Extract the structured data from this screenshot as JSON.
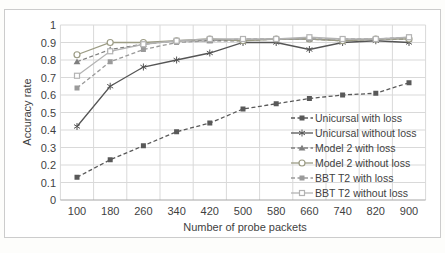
{
  "window": {
    "background": "#fdfdfb",
    "frame_border_color": "#cccccc",
    "plot_background": "#ffffff"
  },
  "chart_data": {
    "type": "line",
    "title": "",
    "xlabel": "Number of probe packets",
    "ylabel": "Accuracy rate",
    "x": [
      100,
      180,
      260,
      340,
      420,
      500,
      580,
      660,
      740,
      820,
      900
    ],
    "x_tick_labels": [
      "100",
      "180",
      "260",
      "340",
      "420",
      "500",
      "580",
      "660",
      "740",
      "820",
      "900"
    ],
    "y_tick_labels": [
      "0",
      "0.1",
      "0.2",
      "0.3",
      "0.4",
      "0.5",
      "0.6",
      "0.7",
      "0.8",
      "0.9",
      "1"
    ],
    "ylim": [
      0,
      1
    ],
    "grid": true,
    "gridline_color": "#d9d9d9",
    "axis_line_color": "#a6a6a6",
    "tick_label_color": "#3f3f3f",
    "legend_position": "inside-bottom-right",
    "legend_text_color": "#3f3f3f",
    "series": [
      {
        "name": "Unicursal with loss",
        "values": [
          0.13,
          0.23,
          0.31,
          0.39,
          0.44,
          0.52,
          0.55,
          0.58,
          0.6,
          0.61,
          0.67
        ],
        "color": "#595959",
        "line_style": "dashed",
        "marker": "square-filled"
      },
      {
        "name": "Unicursal without loss",
        "values": [
          0.42,
          0.65,
          0.76,
          0.8,
          0.84,
          0.9,
          0.9,
          0.86,
          0.9,
          0.91,
          0.9
        ],
        "color": "#555555",
        "line_style": "solid",
        "marker": "star"
      },
      {
        "name": "Model 2 with loss",
        "values": [
          0.79,
          0.86,
          0.89,
          0.91,
          0.91,
          0.91,
          0.92,
          0.92,
          0.91,
          0.92,
          0.92
        ],
        "color": "#7f7f7f",
        "line_style": "dashed",
        "marker": "triangle-filled"
      },
      {
        "name": "Model 2 without loss",
        "values": [
          0.83,
          0.9,
          0.9,
          0.91,
          0.92,
          0.91,
          0.92,
          0.92,
          0.91,
          0.92,
          0.92
        ],
        "color": "#9b9b84",
        "line_style": "solid",
        "marker": "circle-open"
      },
      {
        "name": "BBT T2 with loss",
        "values": [
          0.64,
          0.79,
          0.86,
          0.9,
          0.91,
          0.92,
          0.92,
          0.92,
          0.92,
          0.92,
          0.93
        ],
        "color": "#9a9a9a",
        "line_style": "dashed",
        "marker": "square-filled"
      },
      {
        "name": "BBT T2 without loss",
        "values": [
          0.71,
          0.85,
          0.89,
          0.91,
          0.92,
          0.92,
          0.92,
          0.93,
          0.92,
          0.92,
          0.93
        ],
        "color": "#b3b3b3",
        "line_style": "solid",
        "marker": "square-open"
      }
    ]
  }
}
